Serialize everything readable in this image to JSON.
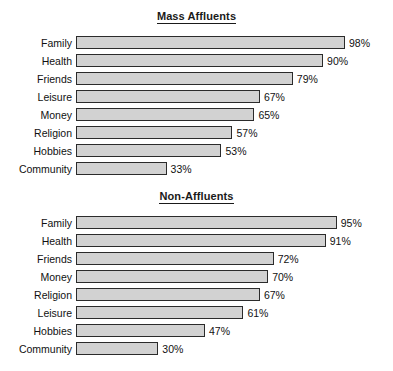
{
  "chart_data": [
    {
      "type": "bar",
      "orientation": "horizontal",
      "title": "Mass Affluents",
      "xlabel": "",
      "ylabel": "",
      "xlim": [
        0,
        100
      ],
      "grid": false,
      "legend": "none",
      "value_suffix": "%",
      "categories": [
        "Family",
        "Health",
        "Friends",
        "Leisure",
        "Money",
        "Religion",
        "Hobbies",
        "Community"
      ],
      "values": [
        98,
        90,
        79,
        67,
        65,
        57,
        53,
        33
      ],
      "value_labels": [
        "98%",
        "90%",
        "79%",
        "67%",
        "65%",
        "57%",
        "53%",
        "33%"
      ],
      "bar_fill": "#d2d2d2",
      "bar_border": "#2b2b2b"
    },
    {
      "type": "bar",
      "orientation": "horizontal",
      "title": "Non-Affluents",
      "xlabel": "",
      "ylabel": "",
      "xlim": [
        0,
        100
      ],
      "grid": false,
      "legend": "none",
      "value_suffix": "%",
      "categories": [
        "Family",
        "Health",
        "Friends",
        "Money",
        "Religion",
        "Leisure",
        "Hobbies",
        "Community"
      ],
      "values": [
        95,
        91,
        72,
        70,
        67,
        61,
        47,
        30
      ],
      "value_labels": [
        "95%",
        "91%",
        "72%",
        "70%",
        "67%",
        "61%",
        "47%",
        "30%"
      ],
      "bar_fill": "#d2d2d2",
      "bar_border": "#2b2b2b"
    }
  ]
}
